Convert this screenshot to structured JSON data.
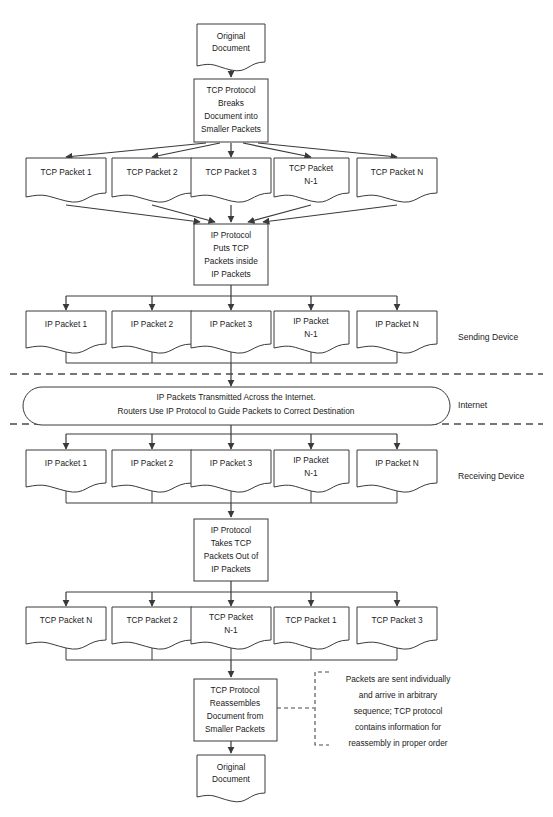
{
  "diagram": {
    "background_color": "#ffffff",
    "line_color": "#3a3a3a",
    "text_color": "#1a1a1a"
  },
  "nodes": {
    "original_document_top": "Original\nDocument",
    "tcp_breaks": "TCP Protocol\nBreaks\nDocument into\nSmaller Packets",
    "ip_puts": "IP Protocol\nPuts TCP\nPackets inside\nIP Packets",
    "internet_oval": "IP Packets Transmitted Across the Internet.\nRouters Use IP Protocol to Guide Packets to Correct Destination",
    "ip_takes": "IP Protocol\nTakes TCP\nPackets Out of\nIP Packets",
    "tcp_reassembles": "TCP Protocol\nReassembles\nDocument from\nSmaller Packets",
    "original_document_bottom": "Original\nDocument"
  },
  "node_lines": {
    "original_document_top": [
      "Original",
      "Document"
    ],
    "tcp_breaks": [
      "TCP Protocol",
      "Breaks",
      "Document into",
      "Smaller Packets"
    ],
    "ip_puts": [
      "IP Protocol",
      "Puts TCP",
      "Packets inside",
      "IP Packets"
    ],
    "internet_oval": [
      "IP Packets Transmitted Across the Internet.",
      "Routers Use IP Protocol to Guide Packets to Correct Destination"
    ],
    "ip_takes": [
      "IP Protocol",
      "Takes TCP",
      "Packets Out of",
      "IP Packets"
    ],
    "tcp_reassembles": [
      "TCP Protocol",
      "Reassembles",
      "Document from",
      "Smaller Packets"
    ],
    "original_document_bottom": [
      "Original",
      "Document"
    ]
  },
  "rows": {
    "tcp_packets_sending": [
      {
        "lines": [
          "TCP Packet 1"
        ]
      },
      {
        "lines": [
          "TCP Packet 2"
        ]
      },
      {
        "lines": [
          "TCP Packet 3"
        ]
      },
      {
        "lines": [
          "TCP Packet",
          "N-1"
        ]
      },
      {
        "lines": [
          "TCP Packet N"
        ]
      }
    ],
    "ip_packets_sending": [
      {
        "lines": [
          "IP Packet 1"
        ]
      },
      {
        "lines": [
          "IP Packet 2"
        ]
      },
      {
        "lines": [
          "IP Packet 3"
        ]
      },
      {
        "lines": [
          "IP Packet",
          "N-1"
        ]
      },
      {
        "lines": [
          "IP Packet N"
        ]
      }
    ],
    "ip_packets_receiving": [
      {
        "lines": [
          "IP Packet 1"
        ]
      },
      {
        "lines": [
          "IP Packet 2"
        ]
      },
      {
        "lines": [
          "IP Packet 3"
        ]
      },
      {
        "lines": [
          "IP Packet",
          "N-1"
        ]
      },
      {
        "lines": [
          "IP Packet N"
        ]
      }
    ],
    "tcp_packets_receiving": [
      {
        "lines": [
          "TCP Packet N"
        ]
      },
      {
        "lines": [
          "TCP Packet 2"
        ]
      },
      {
        "lines": [
          "TCP Packet",
          "N-1"
        ]
      },
      {
        "lines": [
          "TCP Packet 1"
        ]
      },
      {
        "lines": [
          "TCP Packet 3"
        ]
      }
    ]
  },
  "zone_labels": {
    "sending_device": "Sending Device",
    "internet": "Internet",
    "receiving_device": "Receiving Device"
  },
  "callout": {
    "lines": [
      "Packets are sent individually",
      "and arrive in arbitrary",
      "sequence; TCP protocol",
      "contains information for",
      "reassembly in proper order"
    ]
  }
}
